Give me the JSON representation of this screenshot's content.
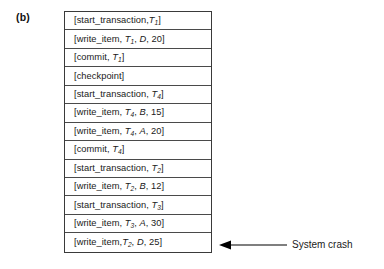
{
  "figure": {
    "panel_label": "(b)",
    "log_title": "Transaction log",
    "rows": [
      {
        "id": "row-1",
        "text": "[start_transaction,T1]",
        "op": "start_transaction",
        "sep": ",",
        "args": [
          {
            "text": "T",
            "sub": "1",
            "italic": true
          }
        ]
      },
      {
        "id": "row-2",
        "text": "[write_item, T1, D, 20]",
        "op": "write_item",
        "sep": ", ",
        "args": [
          {
            "text": "T",
            "sub": "1",
            "italic": true
          },
          {
            "text": "D",
            "italic": true
          },
          {
            "text": "20",
            "italic": false
          }
        ]
      },
      {
        "id": "row-3",
        "text": "[commit, T1]",
        "op": "commit",
        "sep": ", ",
        "args": [
          {
            "text": "T",
            "sub": "1",
            "italic": true
          }
        ]
      },
      {
        "id": "row-4",
        "text": "[checkpoint]",
        "op": "checkpoint",
        "sep": "",
        "args": []
      },
      {
        "id": "row-5",
        "text": "[start_transaction, T4]",
        "op": "start_transaction",
        "sep": ", ",
        "args": [
          {
            "text": "T",
            "sub": "4",
            "italic": true
          }
        ]
      },
      {
        "id": "row-6",
        "text": "[write_item, T4, B, 15]",
        "op": "write_item",
        "sep": ", ",
        "args": [
          {
            "text": "T",
            "sub": "4",
            "italic": true
          },
          {
            "text": "B",
            "italic": true
          },
          {
            "text": "15",
            "italic": false
          }
        ]
      },
      {
        "id": "row-7",
        "text": "[write_item, T4, A, 20]",
        "op": "write_item",
        "sep": ", ",
        "args": [
          {
            "text": "T",
            "sub": "4",
            "italic": true
          },
          {
            "text": "A",
            "italic": true
          },
          {
            "text": "20",
            "italic": false
          }
        ]
      },
      {
        "id": "row-8",
        "text": "[commit, T4]",
        "op": "commit",
        "sep": ", ",
        "args": [
          {
            "text": "T",
            "sub": "4",
            "italic": true
          }
        ]
      },
      {
        "id": "row-9",
        "text": "[start_transaction, T2]",
        "op": "start_transaction",
        "sep": ", ",
        "args": [
          {
            "text": "T",
            "sub": "2",
            "italic": true
          }
        ]
      },
      {
        "id": "row-10",
        "text": "[write_item, T2, B, 12]",
        "op": "write_item",
        "sep": ", ",
        "args": [
          {
            "text": "T",
            "sub": "2",
            "italic": true
          },
          {
            "text": "B",
            "italic": true
          },
          {
            "text": "12",
            "italic": false
          }
        ]
      },
      {
        "id": "row-11",
        "text": "[start_transaction, T3]",
        "op": "start_transaction",
        "sep": ", ",
        "args": [
          {
            "text": "T",
            "sub": "3",
            "italic": true
          }
        ]
      },
      {
        "id": "row-12",
        "text": "[write_item, T3, A, 30]",
        "op": "write_item",
        "sep": ", ",
        "args": [
          {
            "text": "T",
            "sub": "3",
            "italic": true
          },
          {
            "text": "A",
            "italic": true
          },
          {
            "text": "30",
            "italic": false
          }
        ]
      },
      {
        "id": "row-13",
        "text": "[write_item,T2, D, 25]",
        "op": "write_item",
        "sep": ",",
        "args": [
          {
            "text": "T",
            "sub": "2",
            "italic": true
          },
          {
            "text": "D",
            "italic": true
          },
          {
            "text": "25",
            "italic": false
          }
        ]
      }
    ],
    "annotation": {
      "label": "System crash",
      "arrow_icon": "left-arrow-icon",
      "points_to_row": "row-13"
    },
    "colors": {
      "background": "#ffffff",
      "text": "#1a1a1a",
      "border": "#3a3a3a",
      "row_divider": "#4a4a4a",
      "arrow": "#000000"
    }
  }
}
